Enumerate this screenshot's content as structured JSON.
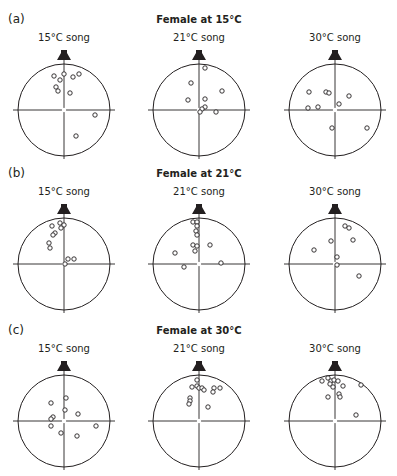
{
  "figure": {
    "panels": [
      {
        "label": "(a)",
        "title": "Female at 15°C",
        "subplots": [
          {
            "label": "15°C song"
          },
          {
            "label": "21°C song"
          },
          {
            "label": "30°C song"
          }
        ]
      },
      {
        "label": "(b)",
        "title": "Female at 21°C",
        "subplots": [
          {
            "label": "15°C song"
          },
          {
            "label": "21°C song"
          },
          {
            "label": "30°C song"
          }
        ]
      },
      {
        "label": "(c)",
        "title": "Female at 30°C",
        "subplots": [
          {
            "label": "15°C song"
          },
          {
            "label": "21°C song"
          },
          {
            "label": "30°C song"
          }
        ]
      }
    ]
  },
  "chart_data": {
    "type": "scatter",
    "arena_radius": 46,
    "colors": {
      "ink": "#231f20",
      "background": "#ffffff"
    },
    "rows": [
      "Female at 15°C",
      "Female at 21°C",
      "Female at 30°C"
    ],
    "columns": [
      "15°C song",
      "21°C song",
      "30°C song"
    ],
    "plots": [
      {
        "row": "Female at 15°C",
        "column": "15°C song",
        "points": [
          [
            -10,
            -34
          ],
          [
            0,
            -36
          ],
          [
            9,
            -33
          ],
          [
            15,
            -36
          ],
          [
            -4,
            -30
          ],
          [
            -8,
            -23
          ],
          [
            -6,
            -19
          ],
          [
            6,
            -17
          ],
          [
            31,
            5
          ],
          [
            12,
            26
          ]
        ]
      },
      {
        "row": "Female at 15°C",
        "column": "21°C song",
        "points": [
          [
            6,
            -42
          ],
          [
            -8,
            -27
          ],
          [
            23,
            -19
          ],
          [
            -11,
            -10
          ],
          [
            6,
            -11
          ],
          [
            6,
            -3
          ],
          [
            3,
            -1
          ],
          [
            1,
            2
          ],
          [
            17,
            2
          ]
        ]
      },
      {
        "row": "Female at 15°C",
        "column": "30°C song",
        "points": [
          [
            -26,
            -18
          ],
          [
            -9,
            -18
          ],
          [
            -6,
            -17
          ],
          [
            14,
            -14
          ],
          [
            4,
            -6
          ],
          [
            -17,
            -3
          ],
          [
            -27,
            -2
          ],
          [
            -3,
            18
          ],
          [
            32,
            18
          ]
        ]
      },
      {
        "row": "Female at 21°C",
        "column": "15°C song",
        "points": [
          [
            -12,
            -38
          ],
          [
            -4,
            -41
          ],
          [
            0,
            -39
          ],
          [
            -3,
            -36
          ],
          [
            -9,
            -31
          ],
          [
            -11,
            -29
          ],
          [
            -15,
            -21
          ],
          [
            -14,
            -16
          ],
          [
            4,
            -5
          ],
          [
            10,
            -5
          ],
          [
            1,
            0
          ]
        ]
      },
      {
        "row": "Female at 21°C",
        "column": "21°C song",
        "points": [
          [
            -6,
            -42
          ],
          [
            -2,
            -42
          ],
          [
            -2,
            -38
          ],
          [
            -3,
            -33
          ],
          [
            -2,
            -29
          ],
          [
            -6,
            -19
          ],
          [
            -2,
            -18
          ],
          [
            11,
            -19
          ],
          [
            -4,
            -13
          ],
          [
            -24,
            -11
          ],
          [
            22,
            -1
          ],
          [
            -15,
            3
          ]
        ]
      },
      {
        "row": "Female at 21°C",
        "column": "30°C song",
        "points": [
          [
            10,
            -38
          ],
          [
            14,
            -36
          ],
          [
            -4,
            -23
          ],
          [
            18,
            -24
          ],
          [
            -21,
            -14
          ],
          [
            2,
            -7
          ],
          [
            2,
            1
          ],
          [
            24,
            12
          ]
        ]
      },
      {
        "row": "Female at 30°C",
        "column": "15°C song",
        "points": [
          [
            2,
            -23
          ],
          [
            -13,
            -18
          ],
          [
            1,
            -11
          ],
          [
            14,
            -7
          ],
          [
            -11,
            -4
          ],
          [
            -13,
            -2
          ],
          [
            -13,
            5
          ],
          [
            32,
            5
          ],
          [
            -3,
            12
          ],
          [
            13,
            15
          ]
        ]
      },
      {
        "row": "Female at 30°C",
        "column": "21°C song",
        "points": [
          [
            -2,
            -41
          ],
          [
            -7,
            -34
          ],
          [
            -2,
            -35
          ],
          [
            0,
            -33
          ],
          [
            3,
            -33
          ],
          [
            5,
            -31
          ],
          [
            15,
            -33
          ],
          [
            21,
            -33
          ],
          [
            14,
            -29
          ],
          [
            -9,
            -23
          ],
          [
            -9,
            -20
          ],
          [
            -10,
            -17
          ],
          [
            9,
            -14
          ]
        ]
      },
      {
        "row": "Female at 30°C",
        "column": "30°C song",
        "points": [
          [
            -13,
            -40
          ],
          [
            -7,
            -43
          ],
          [
            -4,
            -40
          ],
          [
            -1,
            -41
          ],
          [
            3,
            -40
          ],
          [
            -5,
            -37
          ],
          [
            -2,
            -34
          ],
          [
            8,
            -35
          ],
          [
            26,
            -36
          ],
          [
            4,
            -27
          ],
          [
            5,
            -24
          ],
          [
            -7,
            -24
          ],
          [
            21,
            -6
          ]
        ]
      }
    ],
    "xlabel": "",
    "ylabel": "",
    "grid": false,
    "legend": null,
    "annotations": [
      "speaker icon at top of each arena"
    ]
  }
}
